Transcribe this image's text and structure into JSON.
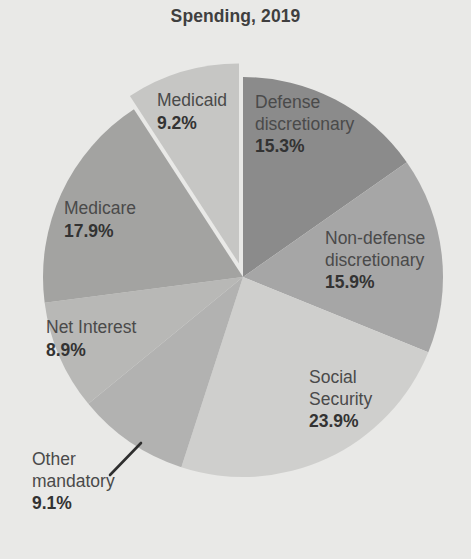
{
  "chart_data": {
    "type": "pie",
    "title": "Spending, 2019",
    "xlabel": "",
    "ylabel": "",
    "legend_position": "none",
    "grid": false,
    "units": "percent",
    "start_angle_deg": 0,
    "direction": "clockwise",
    "categories": [
      "Defense discretionary",
      "Non-defense discretionary",
      "Social Security",
      "Other mandatory",
      "Net Interest",
      "Medicare",
      "Medicaid"
    ],
    "values": [
      15.3,
      15.9,
      23.9,
      9.1,
      8.9,
      17.9,
      9.2
    ],
    "slices": [
      {
        "label": "Defense discretionary",
        "label_line1": "Defense",
        "label_line2": "discretionary",
        "value": 15.3,
        "value_text": "15.3%",
        "color": "#8b8b8b",
        "exploded": false
      },
      {
        "label": "Non-defense discretionary",
        "label_line1": "Non-defense",
        "label_line2": "discretionary",
        "value": 15.9,
        "value_text": "15.9%",
        "color": "#a6a6a6",
        "exploded": false
      },
      {
        "label": "Social Security",
        "label_line1": "Social",
        "label_line2": "Security",
        "value": 23.9,
        "value_text": "23.9%",
        "color": "#cfcfcd",
        "exploded": false
      },
      {
        "label": "Other mandatory",
        "label_line1": "Other",
        "label_line2": "mandatory",
        "value": 9.1,
        "value_text": "9.1%",
        "color": "#b2b2b1",
        "exploded": false
      },
      {
        "label": "Net Interest",
        "label_line1": "Net Interest",
        "label_line2": "",
        "value": 8.9,
        "value_text": "8.9%",
        "color": "#b8b8b6",
        "exploded": false
      },
      {
        "label": "Medicare",
        "label_line1": "Medicare",
        "label_line2": "",
        "value": 17.9,
        "value_text": "17.9%",
        "color": "#a3a3a1",
        "exploded": false
      },
      {
        "label": "Medicaid",
        "label_line1": "Medicaid",
        "label_line2": "",
        "value": 9.2,
        "value_text": "9.2%",
        "color": "#c6c6c4",
        "exploded": true
      }
    ],
    "background_color": "#e9e9e7",
    "title_color": "#3f3f3f"
  }
}
